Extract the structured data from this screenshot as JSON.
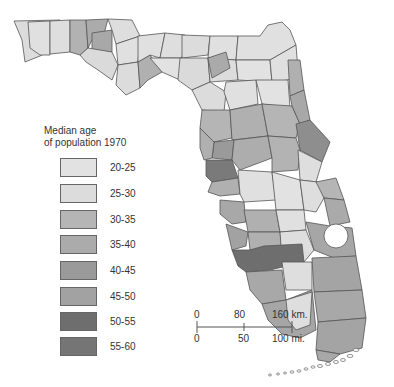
{
  "legend": {
    "title_line1": "Median age",
    "title_line2": "of population 1970",
    "classes": [
      {
        "label": "20-25",
        "color": "#e2e2e2"
      },
      {
        "label": "25-30",
        "color": "#dcdcdc"
      },
      {
        "label": "30-35",
        "color": "#b5b5b5"
      },
      {
        "label": "35-40",
        "color": "#ababab"
      },
      {
        "label": "40-45",
        "color": "#9a9a9a"
      },
      {
        "label": "45-50",
        "color": "#a2a2a2"
      },
      {
        "label": "50-55",
        "color": "#6e6e6e"
      },
      {
        "label": "55-60",
        "color": "#757575"
      }
    ]
  },
  "scale_bar": {
    "km_labels": [
      "0",
      "80",
      "160 km."
    ],
    "mi_labels": [
      "0",
      "50",
      "100 mi."
    ]
  }
}
